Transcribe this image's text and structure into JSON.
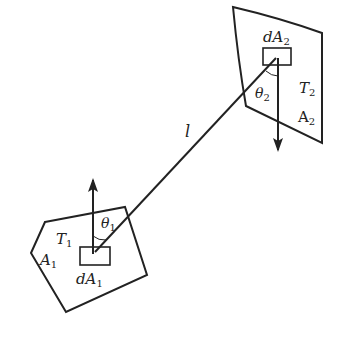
{
  "diagram": {
    "type": "radiative-exchange-between-two-surfaces",
    "surface1": {
      "area_label": "A",
      "area_sub": "1",
      "temp_label": "T",
      "temp_sub": "1",
      "element_label": "dA",
      "element_sub": "1",
      "angle_label": "θ",
      "angle_sub": "1"
    },
    "surface2": {
      "area_label": "A",
      "area_sub": "2",
      "temp_label": "T",
      "temp_sub": "2",
      "element_label": "dA",
      "element_sub": "2",
      "angle_label": "θ",
      "angle_sub": "2"
    },
    "distance_label": "l",
    "colors": {
      "stroke": "#222222",
      "background": "#ffffff"
    }
  }
}
